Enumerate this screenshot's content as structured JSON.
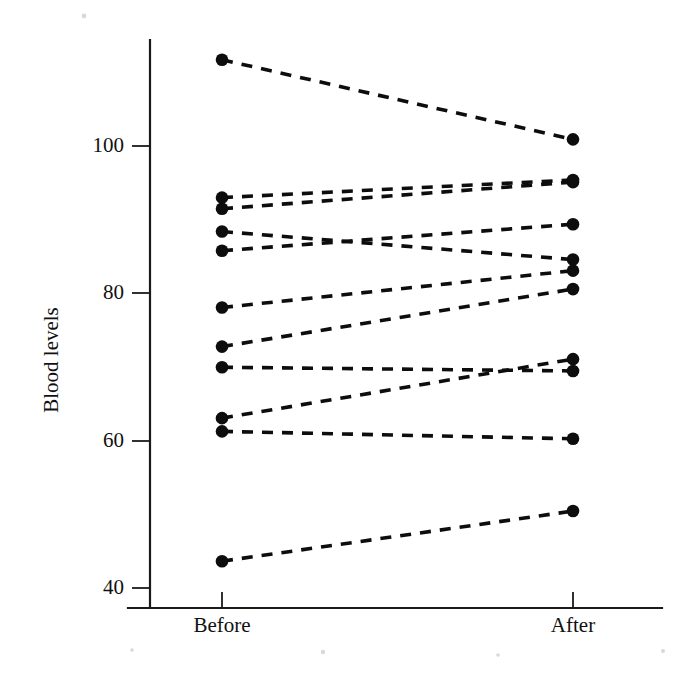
{
  "chart_data": {
    "type": "line",
    "title": "",
    "subtitle": "",
    "xlabel": "",
    "ylabel": "Blood levels",
    "categories": [
      "Before",
      "After"
    ],
    "xtick_labels": [
      "Before",
      "After"
    ],
    "ytick_labels": [
      "40",
      "60",
      "80",
      "100"
    ],
    "yticks": [
      40,
      60,
      80,
      100
    ],
    "ylim": [
      36,
      116
    ],
    "grid": false,
    "legend": false,
    "legend_position": "none",
    "marker": "filled-circle",
    "line_style": "dashed",
    "line_color": "#0d0d0d",
    "marker_color": "#0d0d0d",
    "background_color": "#ffffff",
    "annotation": "Paired before-after plot: each dashed line connects one subject's Before and After blood level.",
    "n_pairs": 12,
    "series": [
      {
        "name": "subject-1",
        "values": [
          111.7,
          100.9
        ]
      },
      {
        "name": "subject-2",
        "values": [
          93.0,
          95.4
        ]
      },
      {
        "name": "subject-3",
        "values": [
          91.5,
          95.1
        ]
      },
      {
        "name": "subject-4",
        "values": [
          88.4,
          84.6
        ]
      },
      {
        "name": "subject-5",
        "values": [
          85.8,
          89.4
        ]
      },
      {
        "name": "subject-6",
        "values": [
          78.1,
          83.1
        ]
      },
      {
        "name": "subject-7",
        "values": [
          72.8,
          80.6
        ]
      },
      {
        "name": "subject-8",
        "values": [
          70.0,
          69.5
        ]
      },
      {
        "name": "subject-9",
        "values": [
          63.1,
          71.1
        ]
      },
      {
        "name": "subject-10",
        "values": [
          61.3,
          60.3
        ]
      },
      {
        "name": "subject-11",
        "values": [
          43.7,
          50.5
        ]
      }
    ],
    "before_values": [
      111.7,
      93.0,
      91.5,
      88.4,
      85.8,
      78.1,
      72.8,
      70.0,
      63.1,
      61.3,
      43.7
    ],
    "after_values": [
      100.9,
      95.4,
      95.1,
      84.6,
      89.4,
      83.1,
      80.6,
      69.5,
      71.1,
      60.3,
      50.5
    ]
  },
  "figure": {
    "y_axis_label": "Blood levels",
    "x_category_before": "Before",
    "x_category_after": "After"
  }
}
